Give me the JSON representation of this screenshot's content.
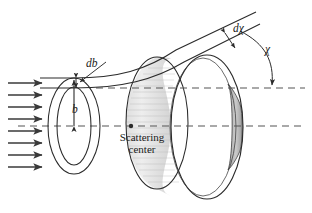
{
  "figure": {
    "name": "classical-scattering-cross-section-diagram",
    "labels": {
      "impact_parameter": "b",
      "impact_parameter_increment": "db",
      "scattering_angle": "χ",
      "scattering_angle_increment": "dχ",
      "scattering_center_line1": "Scattering",
      "scattering_center_line2": "center"
    },
    "colors": {
      "stroke": "#2b2b2b",
      "axis_dash": "#555555",
      "beam_arrow": "#3a3a3a",
      "ring_shade_light": "#e8e8e8",
      "ring_shade_mid": "#cfcfcf",
      "ring_shade_dark": "#b5b5b5",
      "background": "#ffffff"
    },
    "beam": {
      "arrow_count": 8,
      "arrow_x_start": 8,
      "arrow_x_end": 48,
      "arrow_y_positions": [
        83,
        95,
        107,
        119,
        131,
        143,
        155,
        167
      ]
    },
    "axes": {
      "upper_dashed_y": 88,
      "lower_dashed_y": 126,
      "dash_pattern": "7 5"
    },
    "scattering_center_marker": {
      "x": 131,
      "y": 126,
      "r": 2.2
    },
    "target_annulus": {
      "center_x": 74,
      "center_y": 126,
      "outer_rx": 26,
      "outer_ry": 48,
      "inner_rx": 17,
      "inner_ry": 39
    },
    "detector_ring": {
      "front_center_x": 207,
      "front_center_y": 127,
      "front_rx": 36,
      "front_ry": 72,
      "back_center_x": 157,
      "back_center_y": 123,
      "back_rx": 31,
      "back_ry": 66
    }
  }
}
